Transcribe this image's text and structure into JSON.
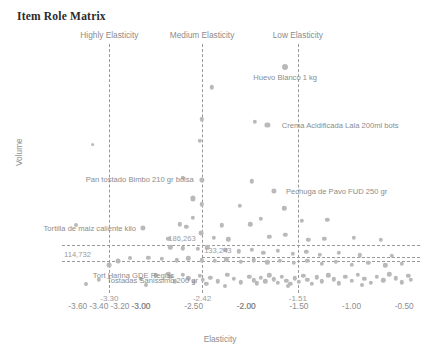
{
  "header": {
    "title": "Item Role Matrix"
  },
  "chart_data": {
    "type": "scatter",
    "title": "Item Role Matrix",
    "xlabel": "Elasticity",
    "ylabel": "Volume",
    "xlim": [
      -3.75,
      -0.35
    ],
    "ylim": [
      -20000,
      1040000
    ],
    "grid": false,
    "legend": "none",
    "xticks": [
      "-3.60",
      "-3.40",
      "-3.20",
      "-3.00",
      "-3.00",
      "-2.50",
      "-2.00",
      "-2.00",
      "-1.50",
      "-1.00",
      "-0.50"
    ],
    "xtick_values": [
      -3.6,
      -3.4,
      -3.2,
      -3.0,
      -3.0,
      -2.5,
      -2.0,
      -2.0,
      -1.5,
      -1.0,
      -0.5
    ],
    "yticks": [
      "0k",
      "100k",
      "200k",
      "300k",
      "400k",
      "500k",
      "600k",
      "700k",
      "800k",
      "900k",
      "1000k"
    ],
    "ytick_values": [
      0,
      100000,
      200000,
      300000,
      400000,
      500000,
      600000,
      700000,
      800000,
      900000,
      1000000
    ],
    "quadrant_labels": [
      {
        "text": "Highly Elasticity",
        "x": -3.3
      },
      {
        "text": "Medium Elasticity",
        "x": -2.42
      },
      {
        "text": "Low Elasticity",
        "x": -1.51
      }
    ],
    "vlines": [
      {
        "x": -3.3,
        "label": "-3.30"
      },
      {
        "x": -2.42,
        "label": "-2.42"
      },
      {
        "x": -1.51,
        "label": "-1.51"
      }
    ],
    "hlines": [
      {
        "y": 114732,
        "label": "114,732",
        "side": "left"
      },
      {
        "y": 186263,
        "label": "186,263",
        "side": "left"
      },
      {
        "y": 133243,
        "label": "133,243",
        "side": "mid"
      }
    ],
    "annotations": [
      {
        "text": "Huevo Blanco 1 kg",
        "x": -1.63,
        "y": 940000,
        "align": "center-below"
      },
      {
        "text": "Crema Acidificada Lala 200ml bots",
        "x": -1.72,
        "y": 697000,
        "align": "right"
      },
      {
        "text": "Pechuga de Pavo FUD 250 gr",
        "x": -1.68,
        "y": 413000,
        "align": "right"
      },
      {
        "text": "Pan tostado Bimbo 210 gr bolsa",
        "x": -2.46,
        "y": 425000,
        "align": "left-above"
      },
      {
        "text": "Tortilla de maiz caliente kilo",
        "x": -2.99,
        "y": 258000,
        "align": "left"
      },
      {
        "text": "Tort Harina GDE Regias",
        "x": -3.07,
        "y": 100000,
        "align": "center"
      },
      {
        "text": "Tostadas Sanissimo 200 gr",
        "x": -3.38,
        "y": 36000,
        "align": "right"
      }
    ],
    "points": [
      {
        "x": -1.63,
        "y": 940000,
        "r": 3.0
      },
      {
        "x": -2.33,
        "y": 855000,
        "r": 2.2
      },
      {
        "x": -2.42,
        "y": 720000,
        "r": 2.2
      },
      {
        "x": -1.92,
        "y": 710000,
        "r": 2.2
      },
      {
        "x": -1.8,
        "y": 697000,
        "r": 2.6
      },
      {
        "x": -2.44,
        "y": 628000,
        "r": 2.2
      },
      {
        "x": -3.46,
        "y": 612000,
        "r": 1.9
      },
      {
        "x": -2.6,
        "y": 470000,
        "r": 2.2
      },
      {
        "x": -2.42,
        "y": 462000,
        "r": 2.6
      },
      {
        "x": -1.95,
        "y": 455000,
        "r": 2.2
      },
      {
        "x": -1.74,
        "y": 413000,
        "r": 2.6
      },
      {
        "x": -2.51,
        "y": 383000,
        "r": 2.6
      },
      {
        "x": -2.42,
        "y": 357000,
        "r": 2.2
      },
      {
        "x": -2.06,
        "y": 352000,
        "r": 2.2
      },
      {
        "x": -1.64,
        "y": 340000,
        "r": 2.2
      },
      {
        "x": -2.98,
        "y": 258000,
        "r": 2.6
      },
      {
        "x": -2.51,
        "y": 300000,
        "r": 2.2
      },
      {
        "x": -2.63,
        "y": 272000,
        "r": 2.2
      },
      {
        "x": -1.86,
        "y": 297000,
        "r": 2.2
      },
      {
        "x": -3.62,
        "y": 268000,
        "r": 2.0
      },
      {
        "x": -2.57,
        "y": 262000,
        "r": 2.2
      },
      {
        "x": -2.23,
        "y": 268000,
        "r": 2.2
      },
      {
        "x": -1.96,
        "y": 272000,
        "r": 2.2
      },
      {
        "x": -1.47,
        "y": 287000,
        "r": 2.2
      },
      {
        "x": -1.23,
        "y": 292000,
        "r": 2.2
      },
      {
        "x": -2.74,
        "y": 212000,
        "r": 2.2
      },
      {
        "x": -2.43,
        "y": 236000,
        "r": 2.4
      },
      {
        "x": -2.31,
        "y": 215000,
        "r": 2.2
      },
      {
        "x": -2.17,
        "y": 208000,
        "r": 2.2
      },
      {
        "x": -1.78,
        "y": 218000,
        "r": 2.2
      },
      {
        "x": -1.63,
        "y": 227000,
        "r": 2.2
      },
      {
        "x": -1.41,
        "y": 206000,
        "r": 2.2
      },
      {
        "x": -1.26,
        "y": 212000,
        "r": 2.2
      },
      {
        "x": -0.98,
        "y": 216000,
        "r": 2.2
      },
      {
        "x": -0.72,
        "y": 206000,
        "r": 2.2
      },
      {
        "x": -2.72,
        "y": 175000,
        "r": 2.2
      },
      {
        "x": -2.6,
        "y": 170000,
        "r": 2.2
      },
      {
        "x": -2.46,
        "y": 168000,
        "r": 2.2
      },
      {
        "x": -2.37,
        "y": 175000,
        "r": 2.2
      },
      {
        "x": -2.2,
        "y": 163000,
        "r": 2.2
      },
      {
        "x": -2.07,
        "y": 158000,
        "r": 2.2
      },
      {
        "x": -1.95,
        "y": 164000,
        "r": 2.2
      },
      {
        "x": -1.84,
        "y": 152000,
        "r": 2.2
      },
      {
        "x": -1.7,
        "y": 160000,
        "r": 2.2
      },
      {
        "x": -1.56,
        "y": 146000,
        "r": 2.2
      },
      {
        "x": -1.43,
        "y": 155000,
        "r": 2.2
      },
      {
        "x": -1.3,
        "y": 142000,
        "r": 2.2
      },
      {
        "x": -1.12,
        "y": 150000,
        "r": 2.2
      },
      {
        "x": -0.92,
        "y": 140000,
        "r": 2.2
      },
      {
        "x": -0.62,
        "y": 138000,
        "r": 2.2
      },
      {
        "x": -3.1,
        "y": 131000,
        "r": 2.0
      },
      {
        "x": -2.93,
        "y": 130000,
        "r": 2.2
      },
      {
        "x": -2.8,
        "y": 126000,
        "r": 2.2
      },
      {
        "x": -2.66,
        "y": 120000,
        "r": 2.2
      },
      {
        "x": -2.55,
        "y": 128000,
        "r": 2.2
      },
      {
        "x": -2.42,
        "y": 120000,
        "r": 2.2
      },
      {
        "x": -2.3,
        "y": 116000,
        "r": 2.2
      },
      {
        "x": -2.19,
        "y": 124000,
        "r": 2.2
      },
      {
        "x": -2.05,
        "y": 112000,
        "r": 2.2
      },
      {
        "x": -1.93,
        "y": 120000,
        "r": 2.2
      },
      {
        "x": -1.8,
        "y": 110000,
        "r": 2.2
      },
      {
        "x": -1.68,
        "y": 118000,
        "r": 2.2
      },
      {
        "x": -1.55,
        "y": 108000,
        "r": 2.2
      },
      {
        "x": -1.42,
        "y": 116000,
        "r": 2.2
      },
      {
        "x": -1.28,
        "y": 104000,
        "r": 2.2
      },
      {
        "x": -1.15,
        "y": 112000,
        "r": 2.2
      },
      {
        "x": -1.0,
        "y": 100000,
        "r": 2.2
      },
      {
        "x": -0.84,
        "y": 108000,
        "r": 2.2
      },
      {
        "x": -0.68,
        "y": 98000,
        "r": 2.2
      },
      {
        "x": -0.52,
        "y": 104000,
        "r": 2.2
      },
      {
        "x": -3.22,
        "y": 114732,
        "r": 2.4
      },
      {
        "x": -3.3,
        "y": 100000,
        "r": 2.4
      },
      {
        "x": -3.4,
        "y": 36000,
        "r": 2.2
      },
      {
        "x": -3.0,
        "y": 40000,
        "r": 2.2
      },
      {
        "x": -2.86,
        "y": 55000,
        "r": 2.2
      },
      {
        "x": -2.74,
        "y": 62000,
        "r": 2.2
      },
      {
        "x": -2.72,
        "y": 48000,
        "r": 2.2
      },
      {
        "x": -2.68,
        "y": 30000,
        "r": 2.2
      },
      {
        "x": -2.6,
        "y": 58000,
        "r": 2.2
      },
      {
        "x": -2.55,
        "y": 42000,
        "r": 2.2
      },
      {
        "x": -2.5,
        "y": 28000,
        "r": 2.2
      },
      {
        "x": -2.44,
        "y": 52000,
        "r": 2.2
      },
      {
        "x": -2.41,
        "y": 35000,
        "r": 2.2
      },
      {
        "x": -2.38,
        "y": 20000,
        "r": 2.2
      },
      {
        "x": -2.34,
        "y": 44000,
        "r": 2.2
      },
      {
        "x": -2.27,
        "y": 30000,
        "r": 2.2
      },
      {
        "x": -2.18,
        "y": 58000,
        "r": 2.2
      },
      {
        "x": -2.12,
        "y": 40000,
        "r": 2.2
      },
      {
        "x": -2.05,
        "y": 26000,
        "r": 2.2
      },
      {
        "x": -1.97,
        "y": 50000,
        "r": 2.2
      },
      {
        "x": -1.93,
        "y": 34000,
        "r": 2.2
      },
      {
        "x": -1.9,
        "y": 22000,
        "r": 2.2
      },
      {
        "x": -1.86,
        "y": 44000,
        "r": 2.2
      },
      {
        "x": -1.82,
        "y": 30000,
        "r": 2.2
      },
      {
        "x": -1.78,
        "y": 55000,
        "r": 2.2
      },
      {
        "x": -1.74,
        "y": 38000,
        "r": 2.2
      },
      {
        "x": -1.7,
        "y": 24000,
        "r": 2.2
      },
      {
        "x": -1.66,
        "y": 48000,
        "r": 2.2
      },
      {
        "x": -1.62,
        "y": 32000,
        "r": 2.2
      },
      {
        "x": -1.58,
        "y": 18000,
        "r": 2.2
      },
      {
        "x": -1.54,
        "y": 42000,
        "r": 2.2
      },
      {
        "x": -1.5,
        "y": 28000,
        "r": 2.2
      },
      {
        "x": -1.46,
        "y": 52000,
        "r": 2.2
      },
      {
        "x": -1.42,
        "y": 36000,
        "r": 2.2
      },
      {
        "x": -1.38,
        "y": 20000,
        "r": 2.2
      },
      {
        "x": -1.33,
        "y": 46000,
        "r": 2.2
      },
      {
        "x": -1.28,
        "y": 30000,
        "r": 2.2
      },
      {
        "x": -1.22,
        "y": 56000,
        "r": 2.2
      },
      {
        "x": -1.17,
        "y": 38000,
        "r": 2.2
      },
      {
        "x": -1.12,
        "y": 22000,
        "r": 2.2
      },
      {
        "x": -1.06,
        "y": 48000,
        "r": 2.2
      },
      {
        "x": -1.0,
        "y": 32000,
        "r": 2.2
      },
      {
        "x": -0.94,
        "y": 58000,
        "r": 2.2
      },
      {
        "x": -0.88,
        "y": 40000,
        "r": 2.2
      },
      {
        "x": -0.82,
        "y": 24000,
        "r": 2.2
      },
      {
        "x": -0.76,
        "y": 50000,
        "r": 2.2
      },
      {
        "x": -0.7,
        "y": 34000,
        "r": 2.2
      },
      {
        "x": -0.64,
        "y": 60000,
        "r": 2.2
      },
      {
        "x": -0.58,
        "y": 42000,
        "r": 2.2
      },
      {
        "x": -0.52,
        "y": 26000,
        "r": 2.2
      },
      {
        "x": -0.46,
        "y": 52000,
        "r": 2.2
      },
      {
        "x": -0.44,
        "y": 36000,
        "r": 2.2
      },
      {
        "x": -3.52,
        "y": 18000,
        "r": 2.0
      },
      {
        "x": -2.95,
        "y": 16000,
        "r": 2.0
      },
      {
        "x": -2.2,
        "y": 10000,
        "r": 2.0
      },
      {
        "x": -1.6,
        "y": 8000,
        "r": 2.0
      },
      {
        "x": -0.9,
        "y": 12000,
        "r": 2.0
      }
    ]
  }
}
